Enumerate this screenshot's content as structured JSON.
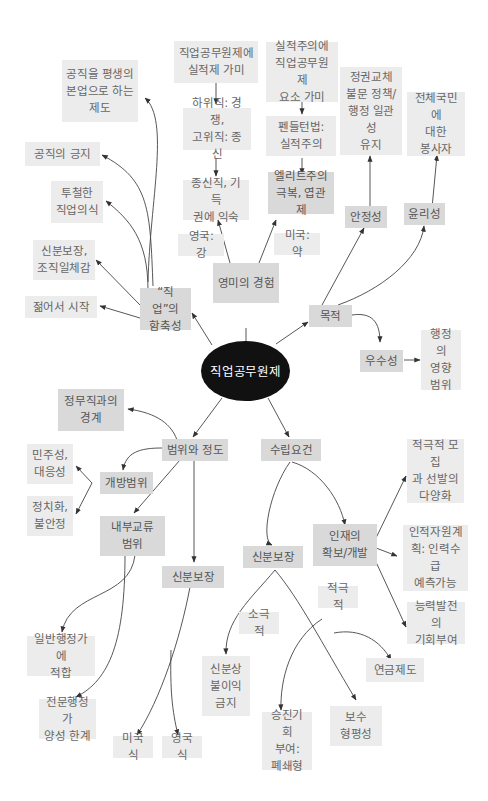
{
  "diagram": {
    "title": "직업공무원제",
    "colors": {
      "center": "#111111",
      "node_mid": "#d9d9d9",
      "node_light": "#ececec",
      "edge": "#333333",
      "background": "#ffffff"
    },
    "nodes": {
      "center": "직업공무원제",
      "implication": "“직업”의\n함축성",
      "lifelong": "공직을 평생의\n본업으로 하는\n제도",
      "pride": "공직의 긍지",
      "vocation": "투철한\n직업의식",
      "security_unity": "신분보장,\n조직일체감",
      "young_start": "젊어서 시작",
      "anglo": "영미의 경험",
      "uk_strong": "영국: 강",
      "us_weak": "미국: 약",
      "career_merit": "직업공무원제에\n실적제 가미",
      "lower_upper": "하위직: 경쟁,\n고위직: 종신",
      "tenure": "종신직, 기득\n권에 익숙",
      "merit_career": "실적주의에\n직업공무원제\n요소 가미",
      "pendleton": "펜들턴법:\n실적주의",
      "elitism": "엘리트주의\n극복, 엽관제",
      "purpose": "목적",
      "stability": "안정성",
      "stability_desc": "정권교체\n불문 정책/\n행정 일관성\n유지",
      "ethics": "윤리성",
      "ethics_desc": "전체국민에\n대한\n봉사자",
      "excellence": "우수성",
      "excellence_desc": "행정의\n영향\n범위",
      "scope": "범위와 정도",
      "political_boundary": "정무직과의\n경계",
      "open_scope": "개방범위",
      "democracy": "민주성,\n대응성",
      "politicization": "정치화,\n불안정",
      "internal_scope": "내부교류\n범위",
      "generalist": "일반행정가에\n적합",
      "specialist": "전문행정가\n양성 한계",
      "scope_security": "신분보장",
      "us_style": "미국식",
      "uk_style": "영국식",
      "requirements": "수립요건",
      "req_security": "신분보장",
      "passive": "소극적",
      "active": "적극적",
      "no_disadvantage": "신분상\n불이익\n금지",
      "promotion": "승진기회\n부여:\n폐쇄형",
      "pay_equity": "보수\n형평성",
      "pension": "연금제도",
      "talent": "인재의\n확보/개발",
      "recruitment": "적극적 모집\n과 선발의\n다양화",
      "hr_planning": "인적자원계\n획: 인력수급\n예측가능",
      "development": "능력발전의\n기회부여"
    }
  }
}
